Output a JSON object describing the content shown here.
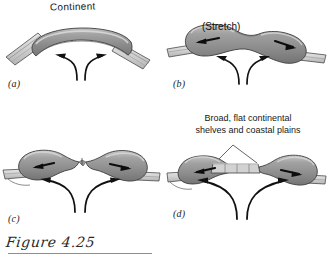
{
  "figure": {
    "caption": "Figure 4.25",
    "panels": [
      {
        "id": "a",
        "letter": "(a)",
        "labels": [
          "Continent"
        ],
        "description": "Single arched continent over mantle upwelling"
      },
      {
        "id": "b",
        "letter": "(b)",
        "labels": [
          "(Stretch)"
        ],
        "description": "Continent stretching and thinning above rising mantle"
      },
      {
        "id": "c",
        "letter": "(c)",
        "labels": [],
        "description": "Continent rifted into two blocks moving apart"
      },
      {
        "id": "d",
        "letter": "(d)",
        "labels": [
          "Broad, flat continental",
          "shelves and coastal plains"
        ],
        "description": "Separated continents with new ocean basin and continental shelves"
      }
    ]
  },
  "colors": {
    "continent_fill": "#8e8e8e",
    "continent_highlight": "#c9c9c9",
    "continent_shadow": "#6e6e6e",
    "plate_fill": "#d4d4d4",
    "plate_edge": "#5a5a5a",
    "shelf_fill": "#cfcfcf",
    "stroke": "#1a1a1a",
    "background": "#ffffff",
    "caption": "#2a2a2a",
    "rule": "#8d8d8d"
  }
}
